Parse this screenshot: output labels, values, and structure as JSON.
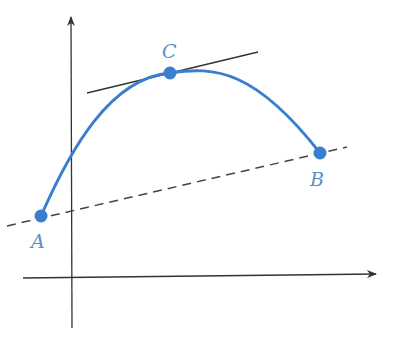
{
  "diagram": {
    "colors": {
      "curve": "#3a7fcf",
      "point": "#3a7fcf",
      "label": "#5a8fc8",
      "axis": "#333333",
      "tangent": "#333333",
      "secant": "#444444",
      "background": "#ffffff"
    },
    "points": [
      {
        "id": "A",
        "label": "A",
        "x": 41,
        "y": 216
      },
      {
        "id": "C",
        "label": "C",
        "x": 170,
        "y": 73
      },
      {
        "id": "B",
        "label": "B",
        "x": 320,
        "y": 153
      }
    ],
    "axes": {
      "x_axis": {
        "from": [
          23,
          278
        ],
        "to": [
          378,
          274
        ]
      },
      "y_axis": {
        "from": [
          72,
          328
        ],
        "to": [
          71,
          15
        ]
      }
    },
    "tangent_line": {
      "from": [
        87,
        93
      ],
      "to": [
        258,
        52
      ],
      "style": "solid"
    },
    "secant_line": {
      "from": [
        7,
        226
      ],
      "to": [
        347,
        147
      ],
      "style": "dashed"
    }
  }
}
